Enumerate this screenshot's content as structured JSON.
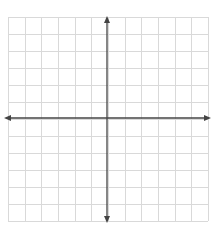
{
  "diagram": {
    "type": "coordinate-plane",
    "grid": {
      "columns": 12,
      "rows": 12,
      "left": 8,
      "top": 17,
      "width": 200,
      "height": 204,
      "line_color": "#d9d9d9"
    },
    "axes": {
      "origin_x": 107,
      "origin_y": 118,
      "color": "#444444",
      "x_axis": {
        "from": 4,
        "to": 211,
        "arrows": "both"
      },
      "y_axis": {
        "from": 16,
        "to": 223,
        "arrows": "both"
      }
    },
    "background": "#ffffff"
  }
}
